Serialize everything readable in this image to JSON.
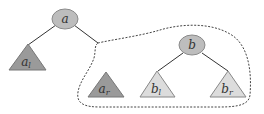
{
  "diagram": {
    "type": "binary-tree-rotation-subtree",
    "nodes": {
      "a": {
        "label": "a"
      },
      "b": {
        "label": "b"
      }
    },
    "subtrees": {
      "a_l": {
        "base": "a",
        "sub": "l"
      },
      "a_r": {
        "base": "a",
        "sub": "r"
      },
      "b_l": {
        "base": "b",
        "sub": "l"
      },
      "b_r": {
        "base": "b",
        "sub": "r"
      }
    },
    "colors": {
      "node_fill": "#bdbdbd",
      "node_stroke": "#8a8a8a",
      "dark_triangle": "#9a9a9a",
      "light_triangle": "#dcdcdc",
      "edge": "#333333",
      "dashed_outline": "#444444"
    }
  }
}
